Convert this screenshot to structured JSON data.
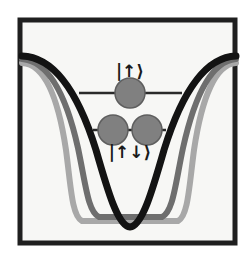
{
  "figure": {
    "name": "potential-well-energy-levels-diagram",
    "background_color": "#f7f7f5",
    "frame": {
      "color": "#1f1f1f",
      "stroke_width": 5,
      "x": 20,
      "y": 20,
      "width": 215,
      "height": 223
    }
  },
  "curves": [
    {
      "name": "shallow-wide-well",
      "label": "light-gray-potential",
      "color": "#a8a8a8",
      "stroke_width": 6,
      "top_y": 63,
      "bottom_y": 222,
      "left_wall_x": 75,
      "right_wall_x": 186,
      "path": "M 22 63 C 44 64 58 96 66 150 C 71 188 72 216 82 221 L 178 221 C 188 216 189 188 194 150 C 202 96 216 64 236 63"
    },
    {
      "name": "medium-narrow-well",
      "label": "medium-gray-potential",
      "color": "#6e6e6e",
      "stroke_width": 6,
      "top_y": 59,
      "bottom_y": 218,
      "left_wall_x": 96,
      "right_wall_x": 166,
      "path": "M 22 59 C 48 61 66 94 78 148 C 86 186 88 212 99 217 L 162 217 C 173 212 175 186 183 148 C 195 94 212 61 236 59"
    },
    {
      "name": "deep-narrow-well",
      "label": "black-potential",
      "color": "#131313",
      "stroke_width": 7,
      "top_y": 56,
      "bottom_y": 228,
      "minimum_x": 130,
      "path": "M 22 56 C 54 57 78 92 96 150 C 108 192 118 226 130 227 C 142 226 152 192 164 150 C 182 92 206 57 236 56"
    }
  ],
  "energy_levels": [
    {
      "name": "upper-level",
      "label": "|↑⟩",
      "label_x": 130,
      "label_y": 77,
      "line_y": 93,
      "line_x1": 79,
      "line_x2": 182,
      "line_color": "#2a2a2a",
      "line_width": 2.5,
      "occupancy": 1,
      "particles": [
        {
          "cx": 130,
          "cy": 93,
          "r": 15
        }
      ]
    },
    {
      "name": "lower-level",
      "label": "|↑↓⟩",
      "label_x": 130,
      "label_y": 158,
      "line_y": 130,
      "line_x1": 93,
      "line_x2": 166,
      "line_color": "#2a2a2a",
      "line_width": 2.5,
      "occupancy": 2,
      "particles": [
        {
          "cx": 113,
          "cy": 130,
          "r": 15
        },
        {
          "cx": 147,
          "cy": 130,
          "r": 15
        }
      ]
    }
  ],
  "particle_style": {
    "fill": "#808080",
    "stroke": "#5e5e5e",
    "stroke_width": 1.5
  },
  "label_style": {
    "font_size": 17,
    "color": "#1a1a1a"
  }
}
